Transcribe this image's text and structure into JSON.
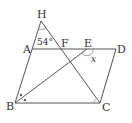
{
  "figure": {
    "type": "geometry",
    "points": {
      "H": {
        "label": "H",
        "x": 41,
        "y": 21
      },
      "A": {
        "label": "A",
        "x": 32,
        "y": 49
      },
      "F": {
        "label": "F",
        "x": 60,
        "y": 49
      },
      "E": {
        "label": "E",
        "x": 87,
        "y": 49
      },
      "D": {
        "label": "D",
        "x": 116,
        "y": 49
      },
      "B": {
        "label": "B",
        "x": 15,
        "y": 103
      },
      "C": {
        "label": "C",
        "x": 100,
        "y": 103
      }
    },
    "labels": {
      "H": "H",
      "A": "A",
      "F": "F",
      "E": "E",
      "D": "D",
      "B": "B",
      "C": "C"
    },
    "angles": {
      "at_H": "54°",
      "at_E": "x"
    },
    "marks": {
      "angle_B_bisected": "•",
      "angle_C": "°"
    },
    "colors": {
      "line": "#555555",
      "text": "#333333"
    }
  }
}
